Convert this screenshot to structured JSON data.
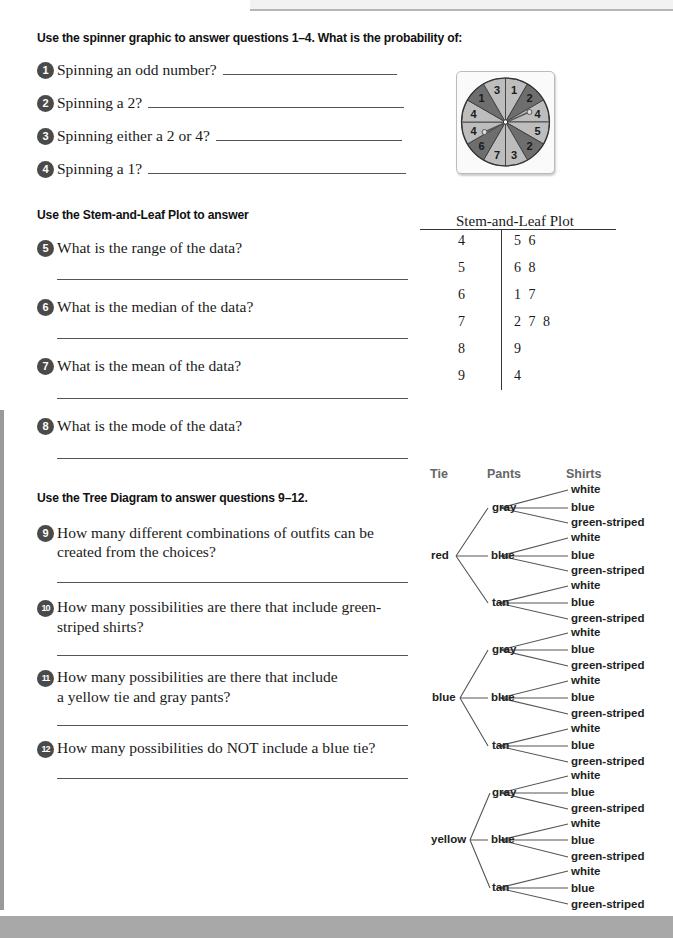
{
  "sections": {
    "spinner": {
      "heading": "Use the spinner graphic to answer questions 1–4. What is the probability of:",
      "questions": [
        {
          "number": "1",
          "text": "Spinning an odd number?"
        },
        {
          "number": "2",
          "text": "Spinning a 2?"
        },
        {
          "number": "3",
          "text": "Spinning either a 2 or 4?"
        },
        {
          "number": "4",
          "text": "Spinning a 1?"
        }
      ],
      "graphic": {
        "sections_clockwise_from_top": [
          {
            "value": "1",
            "shade": "light"
          },
          {
            "value": "2",
            "shade": "dark"
          },
          {
            "value": "4",
            "shade": "light"
          },
          {
            "value": "5",
            "shade": "light"
          },
          {
            "value": "2",
            "shade": "dark"
          },
          {
            "value": "3",
            "shade": "light"
          },
          {
            "value": "7",
            "shade": "light"
          },
          {
            "value": "6",
            "shade": "dark"
          },
          {
            "value": "4",
            "shade": "light"
          },
          {
            "value": "4",
            "shade": "light"
          },
          {
            "value": "1",
            "shade": "dark"
          },
          {
            "value": "3",
            "shade": "light"
          }
        ],
        "colors": {
          "light": "#bdbdbd",
          "dark": "#6e6e6e"
        }
      }
    },
    "stem_leaf": {
      "heading": "Use the Stem-and-Leaf Plot to answer",
      "questions": [
        {
          "number": "5",
          "text": "What is the range of the data?"
        },
        {
          "number": "6",
          "text": "What is the median of the data?"
        },
        {
          "number": "7",
          "text": "What is the mean of the data?"
        },
        {
          "number": "8",
          "text": "What is the mode of the data?"
        }
      ],
      "plot": {
        "title": "Stem-and-Leaf Plot",
        "rows": [
          {
            "stem": "4",
            "leaves": "5 6"
          },
          {
            "stem": "5",
            "leaves": "6 8"
          },
          {
            "stem": "6",
            "leaves": "1 7"
          },
          {
            "stem": "7",
            "leaves": "2 7 8"
          },
          {
            "stem": "8",
            "leaves": "9"
          },
          {
            "stem": "9",
            "leaves": "4"
          }
        ]
      }
    },
    "tree": {
      "heading": "Use the Tree Diagram to answer questions 9–12.",
      "questions": [
        {
          "number": "9",
          "line1": "How many different combinations of outfits can be",
          "line2": "created from the choices?"
        },
        {
          "number": "10",
          "line1": "How many possibilities are there that include green-",
          "line2": "striped shirts?"
        },
        {
          "number": "11",
          "line1": "How many possibilities are there that include",
          "line2": "a yellow tie and gray pants?"
        },
        {
          "number": "12",
          "line1": "How many possibilities do NOT include a blue tie?",
          "line2": ""
        }
      ],
      "diagram": {
        "headers": {
          "tie": "Tie",
          "pants": "Pants",
          "shirts": "Shirts"
        },
        "ties": [
          "red",
          "blue",
          "yellow"
        ],
        "pants": [
          "gray",
          "blue",
          "tan"
        ],
        "shirts": [
          "white",
          "blue",
          "green-striped"
        ]
      }
    }
  }
}
